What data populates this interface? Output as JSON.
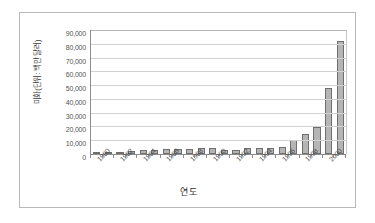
{
  "chart_data": {
    "type": "bar",
    "title": "",
    "xlabel": "연도",
    "ylabel": "미화(단위: 백만 달러)",
    "ylim": [
      0,
      90000
    ],
    "ytick_values": [
      90000,
      80000,
      70000,
      60000,
      50000,
      40000,
      30000,
      20000,
      10000,
      0
    ],
    "ytick_labels": [
      "90,000",
      "80,000",
      "70,000",
      "60,000",
      "50,000",
      "40,000",
      "30,000",
      "20,000",
      "10,000",
      "0"
    ],
    "grid": true,
    "legend": null,
    "categories": [
      "1980",
      "1981",
      "1982",
      "1983",
      "1984",
      "1985",
      "1986",
      "1987",
      "1988",
      "1989",
      "1990",
      "1991",
      "1992",
      "1993",
      "1994",
      "1995",
      "1996",
      "1997",
      "1998",
      "1999",
      "2000",
      "2001"
    ],
    "xtick_labels_shown": [
      "1980",
      "1982",
      "1984",
      "1986",
      "1988",
      "1990",
      "1992",
      "1994",
      "1996",
      "1998",
      "2000"
    ],
    "values": [
      400,
      1100,
      1200,
      2300,
      2900,
      2900,
      3300,
      3700,
      4000,
      4200,
      4200,
      3200,
      2700,
      4300,
      4400,
      4500,
      4900,
      10400,
      14200,
      19500,
      48000,
      82000
    ],
    "series_name": "수출액"
  },
  "axis": {
    "y_title": "미화(단위: 백만 달러)",
    "x_title": "연도"
  },
  "style": {
    "bar_fill": "#b5b5b5",
    "bar_border": "#6f6f6f",
    "gridline": "#d2d2d2",
    "axis_line": "#8d8d8d",
    "frame_border": "#b9b9b9",
    "text_color": "#4a4a4a"
  }
}
